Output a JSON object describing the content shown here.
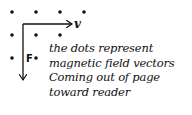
{
  "diagram": {
    "velocity_label": "v",
    "force_label": "F",
    "dot_rows": [
      4,
      3,
      2
    ],
    "note_lines": [
      "the dots represent",
      "magnetic field vectors",
      "Coming out of page",
      "toward reader"
    ],
    "ink_color": "#111111"
  }
}
